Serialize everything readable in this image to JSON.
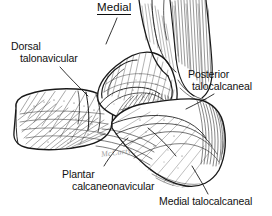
{
  "figure": {
    "title": "Medial",
    "view": "Medial view of the foot and ankle ligaments",
    "background_color": "#ffffff",
    "ink_color": "#1a1a1a",
    "width": 272,
    "height": 216
  },
  "labels": [
    {
      "id": "dorsal-talonavicular",
      "line1": "Dorsal",
      "line2": "talonavicular",
      "leader": "from label down-right to dorsal aspect of talonavicular joint"
    },
    {
      "id": "posterior-talocalcaneal",
      "line1": "Posterior",
      "line2": "talocalcaneal",
      "leader": "from label down-left to posterior subtalar region"
    },
    {
      "id": "plantar-calcaneonavicular",
      "line1": "Plantar",
      "line2": "calcaneonavicular",
      "leader": "from label up-right to spring ligament under sustentaculum"
    },
    {
      "id": "medial-talocalcaneal",
      "line1": "Medial talocalcaneal",
      "line2": "",
      "leader": "from label up-left to medial talocalcaneal ligament"
    }
  ],
  "signature": {
    "text": "McCarty",
    "note": "artist signature, faint cursive"
  },
  "anatomy": {
    "structures": [
      "tibia",
      "achilles tendon region",
      "talus",
      "calcaneus",
      "navicular",
      "cuneiform",
      "sustentaculum tali",
      "deltoid ligament fibers"
    ]
  }
}
